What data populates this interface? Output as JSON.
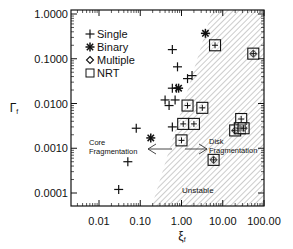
{
  "chart_data": {
    "type": "scatter",
    "title": "",
    "xlabel": "ξ_f",
    "ylabel": "Γ_f",
    "xscale": "log",
    "yscale": "log",
    "xlim": [
      0.002,
      100
    ],
    "ylim": [
      5e-05,
      1.0
    ],
    "x_ticks": [
      "0.01",
      "0.10",
      "1.00",
      "10.00",
      "100.00"
    ],
    "y_ticks": [
      "1.0000",
      "0.1000",
      "0.0100",
      "0.0010",
      "0.0001"
    ],
    "grid": false,
    "legend_position": "upper-left",
    "legend": [
      "Single",
      "Binary",
      "Multiple",
      "NRT"
    ],
    "annotations": [
      {
        "text": "Core",
        "line2": "Fragmentation",
        "arrow": "left"
      },
      {
        "text": "Disk",
        "line2": "Fragmentation",
        "arrow": "right"
      },
      {
        "text": "Unstable",
        "region": "hatched, lower-right of boundary line"
      }
    ],
    "series": [
      {
        "name": "Single",
        "marker": "plus",
        "points": [
          [
            0.03,
            0.00012
          ],
          [
            0.05,
            0.0005
          ],
          [
            0.08,
            0.0028
          ],
          [
            0.6,
            0.16
          ],
          [
            0.8,
            0.066
          ],
          [
            1.4,
            0.036
          ],
          [
            1.8,
            0.042
          ],
          [
            0.6,
            0.022
          ],
          [
            0.75,
            0.022
          ],
          [
            0.4,
            0.012
          ],
          [
            0.5,
            0.009
          ],
          [
            0.7,
            0.012
          ],
          [
            0.6,
            0.003
          ]
        ]
      },
      {
        "name": "Binary",
        "marker": "asterisk",
        "points": [
          [
            0.18,
            0.0017
          ],
          [
            3.8,
            0.37
          ],
          [
            0.85,
            0.022
          ]
        ]
      },
      {
        "name": "Multiple",
        "marker": "diamond",
        "points": [
          [
            55.0,
            0.13
          ],
          [
            20.0,
            0.0025
          ],
          [
            26.0,
            0.0028
          ],
          [
            32.0,
            0.0028
          ],
          [
            6.0,
            0.00055
          ]
        ]
      },
      {
        "name": "NRT",
        "marker": "square",
        "points": [
          [
            6.5,
            0.2
          ],
          [
            55.0,
            0.13
          ],
          [
            1.4,
            0.009
          ],
          [
            3.2,
            0.008
          ],
          [
            2.0,
            0.0035
          ],
          [
            28.0,
            0.0045
          ],
          [
            20.0,
            0.0025
          ],
          [
            26.0,
            0.0028
          ],
          [
            32.0,
            0.0028
          ],
          [
            6.0,
            0.00055
          ],
          [
            1.1,
            0.0035
          ],
          [
            1.0,
            0.0015
          ]
        ]
      }
    ],
    "boundary_line": [
      [
        0.3,
        5e-05
      ],
      [
        5.0,
        1.0
      ]
    ]
  }
}
